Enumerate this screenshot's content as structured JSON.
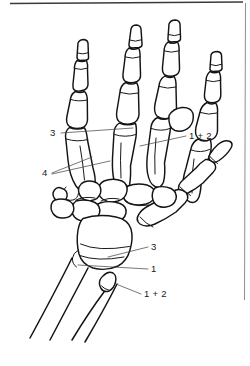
{
  "figure": {
    "background_color": "#ffffff",
    "line_color": "#141414",
    "leader_color": "#4a4a4a",
    "frame": {
      "top_rule_color": "#3a3a3a",
      "right_rule_color": "#8e8e8e"
    }
  },
  "labels": [
    {
      "id": "label-3-upper",
      "text": "3",
      "x": 50,
      "y": 136,
      "anchor": "start",
      "description": "leader to proximal phalanx base row"
    },
    {
      "id": "label-4",
      "text": "4",
      "x": 42,
      "y": 176,
      "anchor": "start",
      "description": "double leader to metacarpal shafts"
    },
    {
      "id": "label-1plus2-upper",
      "text": "1 + 2",
      "x": 189,
      "y": 139,
      "anchor": "start",
      "description": "leader to metacarpophalangeal joint region"
    },
    {
      "id": "label-3-lower",
      "text": "3",
      "x": 151,
      "y": 250,
      "anchor": "start",
      "description": "leader to distal radius epiphyseal line"
    },
    {
      "id": "label-1-lower",
      "text": "1",
      "x": 151,
      "y": 272,
      "anchor": "start",
      "description": "leader to radius metaphysis"
    },
    {
      "id": "label-1plus2-lower",
      "text": "1 + 2",
      "x": 144,
      "y": 297,
      "anchor": "start",
      "description": "leader to ulnar styloid process"
    }
  ],
  "leader_lines": [
    {
      "id": "leader-3-upper",
      "points": "61,133 133,128"
    },
    {
      "id": "leader-4-a",
      "points": "52,173 92,158"
    },
    {
      "id": "leader-4-b",
      "points": "52,174 110,161"
    },
    {
      "id": "leader-1plus2-upper",
      "points": "186,136 140,146"
    },
    {
      "id": "leader-3-lower",
      "points": "148,247 108,257"
    },
    {
      "id": "leader-1-lower",
      "points": "148,269 78,265"
    },
    {
      "id": "leader-1plus2-lower",
      "points": "141,294 116,284"
    }
  ],
  "anatomy_parts": [
    {
      "name": "distal-phalanx-index",
      "digit": 2
    },
    {
      "name": "middle-phalanx-index",
      "digit": 2
    },
    {
      "name": "proximal-phalanx-index",
      "digit": 2
    },
    {
      "name": "metacarpal-index",
      "digit": 2
    },
    {
      "name": "distal-phalanx-middle",
      "digit": 3
    },
    {
      "name": "middle-phalanx-middle",
      "digit": 3
    },
    {
      "name": "proximal-phalanx-middle",
      "digit": 3
    },
    {
      "name": "metacarpal-middle",
      "digit": 3
    },
    {
      "name": "distal-phalanx-ring",
      "digit": 4
    },
    {
      "name": "middle-phalanx-ring",
      "digit": 4
    },
    {
      "name": "proximal-phalanx-ring",
      "digit": 4
    },
    {
      "name": "metacarpal-ring",
      "digit": 4
    },
    {
      "name": "distal-phalanx-little",
      "digit": 5
    },
    {
      "name": "middle-phalanx-little",
      "digit": 5
    },
    {
      "name": "proximal-phalanx-little",
      "digit": 5
    },
    {
      "name": "metacarpal-little",
      "digit": 5
    },
    {
      "name": "distal-phalanx-thumb",
      "digit": 1
    },
    {
      "name": "proximal-phalanx-thumb",
      "digit": 1
    },
    {
      "name": "metacarpal-thumb",
      "digit": 1
    },
    {
      "name": "carpal-bones",
      "digit": 0
    },
    {
      "name": "radius",
      "digit": 0
    },
    {
      "name": "ulna",
      "digit": 0
    },
    {
      "name": "sesamoid-ring",
      "digit": 5
    }
  ]
}
